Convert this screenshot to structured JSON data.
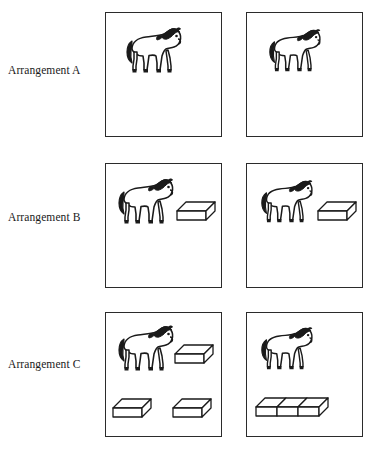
{
  "figure": {
    "background_color": "#ffffff",
    "line_color": "#2b2b2b",
    "rows": [
      {
        "id": "row-a",
        "label": "Arrangement A",
        "panels": [
          {
            "id": "panel-a-left",
            "position": "left",
            "objects": [
              {
                "kind": "horse",
                "name": "horse-figure",
                "x": 18,
                "y": 14,
                "w": 62,
                "h": 52
              }
            ],
            "object_counts": {
              "horses": 1,
              "blocks": 0
            }
          },
          {
            "id": "panel-a-right",
            "position": "right",
            "objects": [
              {
                "kind": "horse",
                "name": "horse-figure",
                "x": 20,
                "y": 14,
                "w": 58,
                "h": 52
              }
            ],
            "object_counts": {
              "horses": 1,
              "blocks": 0
            }
          }
        ]
      },
      {
        "id": "row-b",
        "label": "Arrangement B",
        "panels": [
          {
            "id": "panel-b-left",
            "position": "left",
            "objects": [
              {
                "kind": "horse",
                "name": "horse-figure",
                "x": 10,
                "y": 14,
                "w": 62,
                "h": 52
              },
              {
                "kind": "block",
                "name": "block-figure",
                "x": 70,
                "y": 36,
                "w": 40,
                "h": 26,
                "units": 1
              }
            ],
            "object_counts": {
              "horses": 1,
              "blocks": 1
            }
          },
          {
            "id": "panel-b-right",
            "position": "right",
            "objects": [
              {
                "kind": "horse",
                "name": "horse-figure",
                "x": 12,
                "y": 14,
                "w": 58,
                "h": 52
              },
              {
                "kind": "block",
                "name": "block-figure",
                "x": 70,
                "y": 36,
                "w": 40,
                "h": 26,
                "units": 1
              }
            ],
            "object_counts": {
              "horses": 1,
              "blocks": 1
            }
          }
        ]
      },
      {
        "id": "row-c",
        "label": "Arrangement C",
        "panels": [
          {
            "id": "panel-c-left",
            "position": "left",
            "objects": [
              {
                "kind": "horse",
                "name": "horse-figure",
                "x": 10,
                "y": 12,
                "w": 62,
                "h": 52
              },
              {
                "kind": "block",
                "name": "block-figure",
                "x": 68,
                "y": 30,
                "w": 40,
                "h": 26,
                "units": 1
              },
              {
                "kind": "block",
                "name": "block-figure",
                "x": 6,
                "y": 84,
                "w": 40,
                "h": 26,
                "units": 1
              },
              {
                "kind": "block",
                "name": "block-figure",
                "x": 66,
                "y": 84,
                "w": 40,
                "h": 26,
                "units": 1
              }
            ],
            "object_counts": {
              "horses": 1,
              "blocks": 3
            }
          },
          {
            "id": "panel-c-right",
            "position": "right",
            "objects": [
              {
                "kind": "horse",
                "name": "horse-figure",
                "x": 12,
                "y": 12,
                "w": 58,
                "h": 52
              },
              {
                "kind": "block-row",
                "name": "joined-block-row-figure",
                "x": 8,
                "y": 82,
                "w": 90,
                "h": 28,
                "units": 3
              }
            ],
            "object_counts": {
              "horses": 1,
              "blocks": 3
            }
          }
        ]
      }
    ],
    "panel_geometry": {
      "left_x": 105,
      "right_x": 246,
      "width": 117,
      "height": 125,
      "row_tops": [
        12,
        163,
        312
      ]
    }
  }
}
